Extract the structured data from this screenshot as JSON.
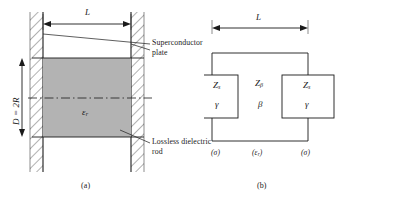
{
  "figure": {
    "panel_a": {
      "caption": "(a)",
      "dimension_width_label": "L",
      "dimension_height_label": "D = 2R",
      "rod_permittivity_symbol": "ε",
      "rod_permittivity_subscript": "r",
      "callouts": [
        {
          "name": "superconductor-plate",
          "text": "Superconductor plate"
        },
        {
          "name": "lossless-dielectric-rod",
          "text": "Lossless dielectric rod"
        }
      ]
    },
    "panel_b": {
      "caption": "(b)",
      "dimension_width_label": "L",
      "left_block": {
        "impedance_symbol": "Z",
        "impedance_subscript": "s",
        "propagation_symbol": "γ",
        "material_label": "(σ)"
      },
      "middle_block": {
        "impedance_symbol": "Z",
        "impedance_subscript": "β",
        "propagation_symbol": "β",
        "material_symbol": "ε",
        "material_subscript": "r",
        "material_label_open": "(",
        "material_label_close": ")"
      },
      "right_block": {
        "impedance_symbol": "Z",
        "impedance_subscript": "s",
        "propagation_symbol": "γ",
        "material_label": "(σ)"
      }
    }
  },
  "colors": {
    "line": "#1a1a1a",
    "rod_fill": "#b3b3b3",
    "hatch": "#555555",
    "background": "#ffffff"
  }
}
